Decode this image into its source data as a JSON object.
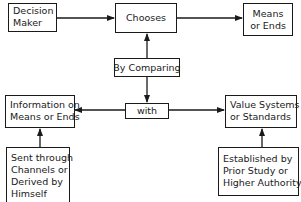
{
  "diagram": {
    "nodes": {
      "decision_maker": {
        "lines": [
          "Decision",
          "Maker"
        ]
      },
      "chooses": {
        "lines": [
          "Chooses"
        ]
      },
      "means_or_ends": {
        "lines": [
          "Means",
          "or Ends"
        ]
      },
      "by_comparing": {
        "lines": [
          "By Comparing"
        ]
      },
      "with": {
        "lines": [
          "with"
        ]
      },
      "information": {
        "lines": [
          "Information on",
          "Means or Ends"
        ]
      },
      "value_systems": {
        "lines": [
          "Value Systems",
          "or Standards"
        ]
      },
      "sent_through": {
        "lines": [
          "Sent through",
          "Channels or",
          "Derived by",
          "Himself"
        ]
      },
      "established_by": {
        "lines": [
          "Established by",
          "Prior Study or",
          "Higher Authority"
        ]
      }
    },
    "edges": [
      {
        "from": "Decision Maker",
        "to": "Chooses"
      },
      {
        "from": "Chooses",
        "to": "Means or Ends"
      },
      {
        "from": "By Comparing",
        "to": "Chooses"
      },
      {
        "from": "By Comparing",
        "to": "with"
      },
      {
        "from": "with",
        "to": "Information on Means or Ends"
      },
      {
        "from": "with",
        "to": "Value Systems or Standards"
      },
      {
        "from": "Sent through Channels or Derived by Himself",
        "to": "Information on Means or Ends"
      },
      {
        "from": "Established by Prior Study or Higher Authority",
        "to": "Value Systems or Standards"
      }
    ],
    "colors": {
      "ink": "#1a1a1a",
      "background": "#ffffff"
    }
  }
}
